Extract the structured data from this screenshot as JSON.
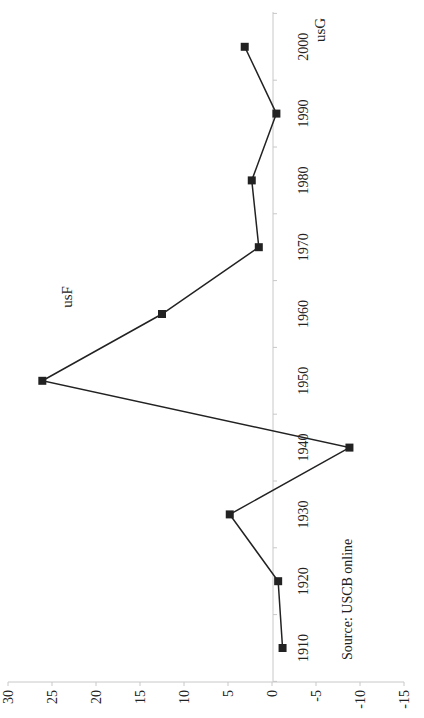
{
  "chart_data": {
    "type": "line",
    "orientation": "rotated-90-clockwise",
    "title": "",
    "xlabel": "",
    "ylabel": "",
    "categories": [
      "1910",
      "1920",
      "1930",
      "1940",
      "1950",
      "1960",
      "1970",
      "1980",
      "1990",
      "2000"
    ],
    "series": [
      {
        "name": "usF/usG",
        "values": [
          -1.2,
          -0.7,
          4.8,
          -8.8,
          26.1,
          12.5,
          1.5,
          2.3,
          -0.5,
          3.1
        ]
      }
    ],
    "ylim": [
      -15,
      30
    ],
    "yticks": [
      "30",
      "25",
      "20",
      "15",
      "10",
      "5",
      "0",
      "-5",
      "-10",
      "-15"
    ],
    "grid": false,
    "annotations": [
      "usF",
      "usG",
      "Source: USCB online"
    ]
  },
  "labels": {
    "usF": "usF",
    "usG": "usG",
    "source": "Source: USCB online"
  },
  "colors": {
    "line": "#222222",
    "axis": "#c8c8c8",
    "text": "#222222"
  }
}
